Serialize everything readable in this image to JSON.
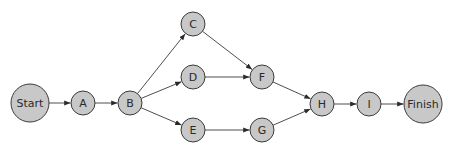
{
  "diagram": {
    "type": "activity-network",
    "nodes": [
      {
        "id": "start",
        "label": "Start",
        "x": 30,
        "y": 103,
        "r": 19
      },
      {
        "id": "a",
        "label": "A",
        "x": 83,
        "y": 103,
        "r": 12
      },
      {
        "id": "b",
        "label": "B",
        "x": 130,
        "y": 103,
        "r": 12
      },
      {
        "id": "c",
        "label": "C",
        "x": 193,
        "y": 24,
        "r": 12
      },
      {
        "id": "d",
        "label": "D",
        "x": 193,
        "y": 77,
        "r": 12
      },
      {
        "id": "e",
        "label": "E",
        "x": 193,
        "y": 130,
        "r": 12
      },
      {
        "id": "f",
        "label": "F",
        "x": 262,
        "y": 77,
        "r": 12
      },
      {
        "id": "g",
        "label": "G",
        "x": 262,
        "y": 130,
        "r": 12
      },
      {
        "id": "h",
        "label": "H",
        "x": 322,
        "y": 104,
        "r": 12
      },
      {
        "id": "i",
        "label": "I",
        "x": 369,
        "y": 104,
        "r": 12
      },
      {
        "id": "finish",
        "label": "Finish",
        "x": 423,
        "y": 104,
        "r": 19
      }
    ],
    "edges": [
      [
        "start",
        "a"
      ],
      [
        "a",
        "b"
      ],
      [
        "b",
        "c"
      ],
      [
        "b",
        "d"
      ],
      [
        "b",
        "e"
      ],
      [
        "c",
        "f"
      ],
      [
        "d",
        "f"
      ],
      [
        "e",
        "g"
      ],
      [
        "f",
        "h"
      ],
      [
        "g",
        "h"
      ],
      [
        "h",
        "i"
      ],
      [
        "i",
        "finish"
      ]
    ]
  }
}
